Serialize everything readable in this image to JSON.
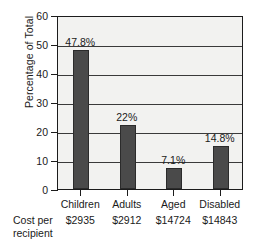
{
  "chart_data": {
    "type": "bar",
    "title": "",
    "xlabel": "",
    "ylabel": "Percentage of Total",
    "categories": [
      "Children",
      "Adults",
      "Aged",
      "Disabled"
    ],
    "values": [
      47.8,
      22,
      7.1,
      14.8
    ],
    "value_labels": [
      "47.8%",
      "22%",
      "7.1%",
      "14.8%"
    ],
    "ylim": [
      0,
      60
    ],
    "ytick_labels": [
      "0",
      "10",
      "20",
      "30",
      "40",
      "50",
      "60"
    ],
    "ytick_values": [
      0,
      10,
      20,
      30,
      40,
      50,
      60
    ],
    "grid": true,
    "legend": false,
    "bar_color": "#4a4a4a",
    "plot_background": "#f2f2f0",
    "axis_color": "#1c1c1c",
    "secondary_row": {
      "label_line1": "Cost per",
      "label_line2": "recipient",
      "values": [
        "$2935",
        "$2912",
        "$14724",
        "$14843"
      ]
    }
  }
}
